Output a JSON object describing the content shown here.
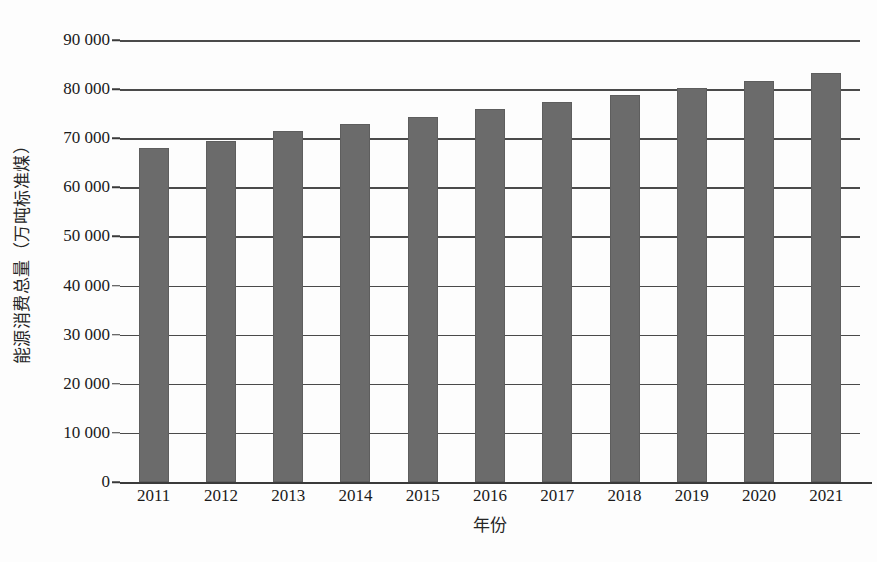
{
  "chart_data": {
    "type": "bar",
    "title": "",
    "xlabel": "年份",
    "ylabel": "能源消费总量（万吨标准煤）",
    "categories": [
      "2011",
      "2012",
      "2013",
      "2014",
      "2015",
      "2016",
      "2017",
      "2018",
      "2019",
      "2020",
      "2021"
    ],
    "values": [
      68000,
      69500,
      71400,
      72800,
      74300,
      75900,
      77300,
      78800,
      80200,
      81700,
      83200
    ],
    "ylim": [
      0,
      90000
    ],
    "y_ticks": [
      0,
      10000,
      20000,
      30000,
      40000,
      50000,
      60000,
      70000,
      80000,
      90000
    ],
    "y_tick_labels": [
      "0",
      "10 000",
      "20 000",
      "30 000",
      "40 000",
      "50 000",
      "60 000",
      "70 000",
      "80 000",
      "90 000"
    ],
    "grid": true,
    "grid_axis": "y",
    "legend": false,
    "bar_color": "#6b6b6b",
    "series": [
      {
        "name": "能源消费总量",
        "values": [
          68000,
          69500,
          71400,
          72800,
          74300,
          75900,
          77300,
          78800,
          80200,
          81700,
          83200
        ]
      }
    ]
  }
}
